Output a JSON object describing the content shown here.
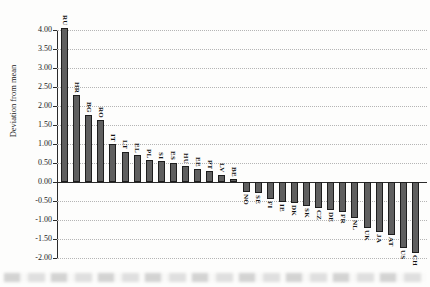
{
  "figure": {
    "background": "#fdfdfc",
    "scan_artifact": "blurred-text-band-bottom"
  },
  "chart_data": {
    "type": "bar",
    "title": "",
    "xlabel": "",
    "ylabel": "Deviation from mean",
    "ylim": [
      -2.0,
      4.0
    ],
    "ytick_step": 0.5,
    "yticks": [
      "4.00",
      "3.50",
      "3.00",
      "2.50",
      "2.00",
      "1.50",
      "1.00",
      "0.50",
      "0.00",
      "-0.50",
      "-1.00",
      "-1.50",
      "-2.00"
    ],
    "grid": "dotted-horizontal",
    "legend": "none",
    "bar_color": "#5f5f5f",
    "bar_border_color": "#1d1d1d",
    "categories": [
      "RU",
      "HR",
      "BG",
      "RO",
      "IT",
      "LT",
      "EL",
      "PL",
      "SI",
      "ES",
      "HU",
      "EE",
      "PT",
      "LV",
      "BE",
      "NO",
      "SE",
      "FI",
      "IE",
      "DK",
      "SK",
      "CZ",
      "DE",
      "FR",
      "NL",
      "UK",
      "JA",
      "AT",
      "US",
      "CH"
    ],
    "values": [
      4.05,
      2.28,
      1.77,
      1.62,
      1.0,
      0.8,
      0.72,
      0.57,
      0.54,
      0.51,
      0.43,
      0.34,
      0.28,
      0.18,
      0.07,
      -0.25,
      -0.3,
      -0.46,
      -0.52,
      -0.56,
      -0.64,
      -0.68,
      -0.74,
      -0.79,
      -0.95,
      -1.21,
      -1.31,
      -1.39,
      -1.74,
      -1.88
    ],
    "bar_label_position": "outside-end-rotated-90"
  }
}
